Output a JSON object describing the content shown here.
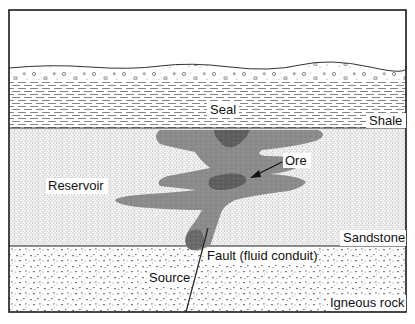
{
  "diagram": {
    "type": "geological cross-section",
    "layers": [
      {
        "id": "topsoil",
        "label": "",
        "pattern": "gravel"
      },
      {
        "id": "shale",
        "label": "Shale",
        "role": "Seal",
        "pattern": "dashes"
      },
      {
        "id": "sandstone",
        "label": "Sandstone",
        "role": "Reservoir",
        "pattern": "fine-dots"
      },
      {
        "id": "igneous",
        "label": "Igneous rock",
        "role": "Source",
        "pattern": "triangles"
      }
    ],
    "labels": {
      "seal": "Seal",
      "shale": "Shale",
      "ore": "Ore",
      "reservoir": "Reservoir",
      "sandstone": "Sandstone",
      "fault": "Fault (fluid conduit)",
      "source": "Source",
      "igneous": "Igneous rock"
    },
    "colors": {
      "frame": "#1a1a1a",
      "plume_light": "#8c8c8c",
      "plume_dark": "#5e5e5e",
      "pattern": "#555555",
      "background": "#ffffff"
    }
  }
}
